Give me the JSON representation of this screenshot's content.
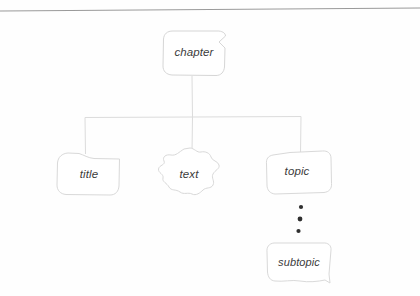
{
  "figure": {
    "kind": "hand-drawn-tree-diagram",
    "background_color": "#fefefe",
    "stroke_color": "#d3d3d3",
    "text_color": "#3b3b3b",
    "dot_color": "#2b2b2b",
    "top_rule": {
      "name": "top-rule",
      "color": "#9a9a9a",
      "from_x": 0,
      "from_y": 11,
      "to_x": 420,
      "to_y": 8
    }
  },
  "nodes": {
    "root": {
      "id": "chapter",
      "label": "chapter",
      "shape": "rounded-box-with-notch",
      "x": 163,
      "y": 30,
      "width": 62,
      "height": 45
    },
    "children": [
      {
        "id": "title",
        "label": "title",
        "shape": "rounded-box",
        "x": 57,
        "y": 152,
        "width": 62,
        "height": 43
      },
      {
        "id": "text",
        "label": "text",
        "shape": "irregular-blob",
        "x": 158,
        "y": 148,
        "width": 62,
        "height": 48
      },
      {
        "id": "topic",
        "label": "topic",
        "shape": "skewed-rounded-box",
        "x": 266,
        "y": 150,
        "width": 66,
        "height": 44
      }
    ],
    "descendant": {
      "id": "subtopic",
      "label": "subtopic",
      "shape": "rounded-box-with-tail",
      "x": 266,
      "y": 242,
      "width": 66,
      "height": 41
    }
  },
  "edges": {
    "root_stem": {
      "name": "edge-chapter-stem",
      "x": 192,
      "from_y": 76,
      "to_y": 117
    },
    "bus": {
      "name": "edge-horizontal-bus",
      "y": 117,
      "from_x": 85,
      "to_x": 301
    },
    "drops": [
      {
        "name": "edge-drop-title",
        "x": 85,
        "from_y": 117,
        "to_y": 154
      },
      {
        "name": "edge-drop-text",
        "x": 192,
        "from_y": 117,
        "to_y": 152
      },
      {
        "name": "edge-drop-topic",
        "x": 301,
        "from_y": 117,
        "to_y": 153
      }
    ]
  },
  "ellipsis": {
    "name": "vertical-ellipsis",
    "label": "vertical ellipsis between topic and subtopic",
    "dots": [
      {
        "cx": 301,
        "cy": 207,
        "r": 2.1
      },
      {
        "cx": 300,
        "cy": 219,
        "r": 2.3
      },
      {
        "cx": 298,
        "cy": 231,
        "r": 2.1
      }
    ]
  }
}
